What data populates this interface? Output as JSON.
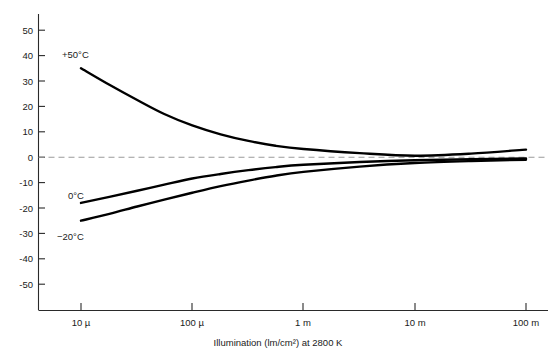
{
  "chart_data": {
    "type": "line",
    "title": "",
    "xlabel": "Illumination (lm/cm²) at 2800 K",
    "ylabel": "",
    "xscale": "log",
    "xlim": [
      5e-06,
      0.14
    ],
    "ylim": [
      -55,
      55
    ],
    "grid": false,
    "legend_position": "inline-labels",
    "zero_reference_line": true,
    "x_tick_labels": [
      "10 µ",
      "100 µ",
      "1 m",
      "10 m",
      "100 m"
    ],
    "x_tick_values": [
      1e-05,
      0.0001,
      0.001,
      0.01,
      0.1
    ],
    "y_tick_labels": [
      "50",
      "40",
      "30",
      "20",
      "10",
      "0",
      "-10",
      "-20",
      "-30",
      "-40",
      "-50"
    ],
    "y_tick_values": [
      50,
      40,
      30,
      20,
      10,
      0,
      -10,
      -20,
      -30,
      -40,
      -50
    ],
    "series": [
      {
        "name": "+50°C",
        "label": "+50°C",
        "color": "#000000",
        "x": [
          1e-05,
          1.8e-05,
          3.2e-05,
          5.6e-05,
          0.0001,
          0.00018,
          0.00032,
          0.00056,
          0.001,
          0.0032,
          0.01,
          0.032,
          0.1
        ],
        "values": [
          35,
          28.5,
          22.5,
          17.0,
          12.5,
          9.0,
          6.4,
          4.5,
          3.2,
          1.6,
          0.6,
          1.4,
          3.0
        ]
      },
      {
        "name": "0°C",
        "label": "0°C",
        "color": "#000000",
        "x": [
          1e-05,
          1.8e-05,
          3.2e-05,
          5.6e-05,
          0.0001,
          0.00018,
          0.00032,
          0.00056,
          0.001,
          0.0032,
          0.01,
          0.032,
          0.1
        ],
        "values": [
          -18.0,
          -15.6,
          -13.2,
          -10.8,
          -8.4,
          -6.6,
          -5.1,
          -3.9,
          -3.0,
          -1.9,
          -1.2,
          -0.8,
          -0.5
        ]
      },
      {
        "name": "-20°C",
        "label": "−20°C",
        "color": "#000000",
        "x": [
          1e-05,
          1.8e-05,
          3.2e-05,
          5.6e-05,
          0.0001,
          0.00018,
          0.00032,
          0.00056,
          0.001,
          0.0032,
          0.01,
          0.032,
          0.1
        ],
        "values": [
          -25.0,
          -22.3,
          -19.4,
          -16.7,
          -14.0,
          -11.4,
          -9.2,
          -7.3,
          -5.8,
          -3.7,
          -2.3,
          -1.5,
          -1.0
        ]
      }
    ],
    "series_label_positions": [
      {
        "label": "+50°C",
        "x_px": 62,
        "y_px": 58
      },
      {
        "label": "0°C",
        "x_px": 68,
        "y_px": 199
      },
      {
        "label": "−20°C",
        "x_px": 57,
        "y_px": 240
      }
    ]
  },
  "caption": {
    "text": ""
  }
}
